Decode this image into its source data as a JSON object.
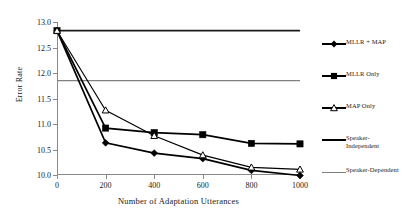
{
  "chart_data": {
    "type": "line",
    "title": "",
    "xlabel": "Number of Adaptation Utterances",
    "ylabel": "Error Rate",
    "xlim": [
      0,
      1000
    ],
    "ylim": [
      10.0,
      13.0
    ],
    "grid": false,
    "legend_position": "right",
    "x": [
      0,
      200,
      400,
      600,
      800,
      1000
    ],
    "xticks": [
      "0",
      "200",
      "400",
      "600",
      "800",
      "1000"
    ],
    "yticks": [
      "10.0",
      "10.5",
      "11.0",
      "11.5",
      "12.0",
      "12.5",
      "13.0"
    ],
    "ytick_values": [
      10.0,
      10.5,
      11.0,
      11.5,
      12.0,
      12.5,
      13.0
    ],
    "series": [
      {
        "name": "MLLR + MAP",
        "marker": "filled-diamond",
        "color": "#000000",
        "values": [
          12.83,
          10.63,
          10.43,
          10.32,
          10.09,
          9.99
        ]
      },
      {
        "name": "MLLR Only",
        "marker": "filled-square",
        "color": "#000000",
        "values": [
          12.83,
          10.92,
          10.83,
          10.79,
          10.62,
          10.61
        ]
      },
      {
        "name": "MAP Only",
        "marker": "open-triangle",
        "color": "#000000",
        "values": [
          12.83,
          11.27,
          10.77,
          10.39,
          10.15,
          10.11
        ]
      }
    ],
    "hlines": [
      {
        "name": "Speaker-Independent",
        "value": 12.83,
        "color": "#1a1a1a"
      },
      {
        "name": "Speaker-Dependent",
        "value": 11.85,
        "color": "#808080"
      }
    ]
  },
  "legend": {
    "items": [
      {
        "label": "MLLR + MAP",
        "marker": "filled-diamond"
      },
      {
        "label": "MLLR Only",
        "marker": "filled-square"
      },
      {
        "label": "MAP Only",
        "marker": "open-triangle"
      },
      {
        "label": "Speaker-\nIndependent",
        "marker": "line-dark"
      },
      {
        "label": "Speaker-Dependent",
        "marker": "line-gray"
      }
    ]
  }
}
